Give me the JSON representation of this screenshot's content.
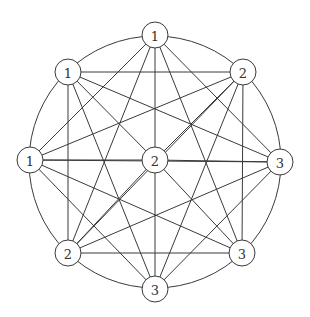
{
  "diagram": {
    "type": "graph",
    "outer_ring": {
      "cx": 155,
      "cy": 162,
      "r": 126
    },
    "node_radius": 13,
    "nodes": [
      {
        "id": "A",
        "label": "1",
        "x": 155,
        "y": 35
      },
      {
        "id": "B",
        "label": "1",
        "x": 68,
        "y": 72
      },
      {
        "id": "C",
        "label": "2",
        "x": 243,
        "y": 72
      },
      {
        "id": "D",
        "label": "1",
        "x": 30,
        "y": 160
      },
      {
        "id": "E",
        "label": "2",
        "x": 155,
        "y": 160
      },
      {
        "id": "F",
        "label": "3",
        "x": 280,
        "y": 162
      },
      {
        "id": "G",
        "label": "2",
        "x": 68,
        "y": 253
      },
      {
        "id": "H",
        "label": "3",
        "x": 242,
        "y": 253
      },
      {
        "id": "I",
        "label": "3",
        "x": 155,
        "y": 289
      }
    ],
    "edges": [
      [
        "A",
        "D"
      ],
      [
        "A",
        "G"
      ],
      [
        "A",
        "E"
      ],
      [
        "A",
        "H"
      ],
      [
        "A",
        "F"
      ],
      [
        "B",
        "C"
      ],
      [
        "B",
        "G"
      ],
      [
        "B",
        "E"
      ],
      [
        "B",
        "F"
      ],
      [
        "B",
        "I"
      ],
      [
        "C",
        "D"
      ],
      [
        "C",
        "E"
      ],
      [
        "C",
        "G"
      ],
      [
        "C",
        "H"
      ],
      [
        "C",
        "I"
      ],
      [
        "D",
        "E"
      ],
      [
        "D",
        "H"
      ],
      [
        "D",
        "I"
      ],
      [
        "D",
        "F"
      ],
      [
        "E",
        "F"
      ],
      [
        "E",
        "G"
      ],
      [
        "E",
        "H"
      ],
      [
        "E",
        "I"
      ],
      [
        "F",
        "G"
      ],
      [
        "F",
        "I"
      ],
      [
        "G",
        "H"
      ]
    ],
    "ring_arcs_between": [
      [
        "A",
        "C"
      ],
      [
        "C",
        "F"
      ],
      [
        "F",
        "H"
      ],
      [
        "H",
        "I"
      ],
      [
        "I",
        "G"
      ],
      [
        "G",
        "D"
      ],
      [
        "D",
        "B"
      ],
      [
        "B",
        "A"
      ]
    ]
  }
}
